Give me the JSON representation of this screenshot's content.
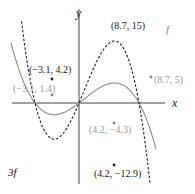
{
  "chart_data": {
    "type": "line",
    "title": "",
    "xlabel": "x",
    "ylabel": "y",
    "grid": false,
    "legend": "inline curve labels",
    "series": [
      {
        "name": "f",
        "style": "solid",
        "color": "#8a8a8a",
        "label": "f",
        "points": [
          {
            "x": -3.1,
            "y": 1.4,
            "label": "(−3.1, 1.4)"
          },
          {
            "x": 4.2,
            "y": -4.3,
            "label": "(4.2, −4.3)"
          },
          {
            "x": 8.7,
            "y": 5,
            "label": "(8.7, 5)"
          }
        ]
      },
      {
        "name": "3f",
        "style": "dashed",
        "color": "#222222",
        "label": "3f",
        "points": [
          {
            "x": -3.1,
            "y": 4.2,
            "label": "(−3.1, 4.2)"
          },
          {
            "x": 4.2,
            "y": -12.9,
            "label": "(4.2, −12.9)"
          },
          {
            "x": 8.7,
            "y": 15,
            "label": "(8.7, 15)"
          }
        ]
      }
    ]
  },
  "labels": {
    "x_axis": "x",
    "y_axis": "y",
    "f_curve": "f",
    "threef_curve": "3f",
    "f_max": "(−3.1, 1.4)",
    "f_min": "(4.2, −4.3)",
    "f_pt": "(8.7, 5)",
    "g_max": "(−3.1, 4.2)",
    "g_min": "(4.2, −12.9)",
    "g_pt": "(8.7, 15)"
  },
  "colors": {
    "f": "#8a8a8a",
    "threef": "#222222",
    "axis": "#444444",
    "f_label": "#9a9a9a",
    "threef_label": "#222222"
  }
}
